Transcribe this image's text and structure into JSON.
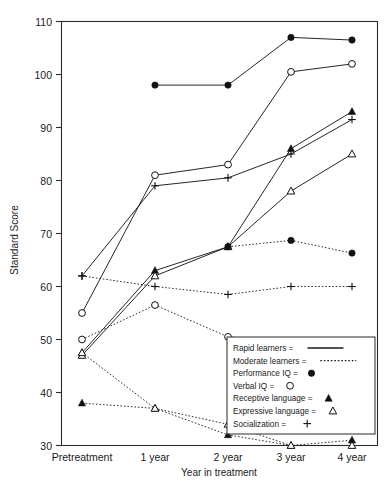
{
  "chart_data": {
    "type": "line",
    "title": "",
    "xlabel": "Year in treatment",
    "ylabel": "Standard Score",
    "categories": [
      "Pretreatment",
      "1 year",
      "2 year",
      "3 year",
      "4 year"
    ],
    "ylim": [
      30,
      110
    ],
    "yticks": [
      30,
      40,
      50,
      60,
      70,
      80,
      90,
      100,
      110
    ],
    "grid": false,
    "legend_position": "bottom-right",
    "series": [
      {
        "name": "Rapid learners — Performance IQ",
        "group": "Rapid learners",
        "measure": "Performance IQ",
        "line": "solid",
        "marker": "filled-circle",
        "values": [
          null,
          98.0,
          98.0,
          107.0,
          106.5
        ]
      },
      {
        "name": "Rapid learners — Verbal IQ",
        "group": "Rapid learners",
        "measure": "Verbal IQ",
        "line": "solid",
        "marker": "open-circle",
        "values": [
          55.0,
          81.0,
          83.0,
          100.5,
          102.0
        ]
      },
      {
        "name": "Rapid learners — Socialization",
        "group": "Rapid learners",
        "measure": "Socialization",
        "line": "solid",
        "marker": "plus",
        "values": [
          62.0,
          79.0,
          80.5,
          85.0,
          91.5
        ]
      },
      {
        "name": "Rapid learners — Receptive language",
        "group": "Rapid learners",
        "measure": "Receptive language",
        "line": "solid",
        "marker": "filled-triangle",
        "values": [
          47.5,
          63.0,
          67.5,
          86.0,
          93.0
        ]
      },
      {
        "name": "Rapid learners — Expressive language",
        "group": "Rapid learners",
        "measure": "Expressive language",
        "line": "solid",
        "marker": "open-triangle",
        "values": [
          47.0,
          62.0,
          67.5,
          78.0,
          85.0
        ]
      },
      {
        "name": "Moderate learners — Performance IQ",
        "group": "Moderate learners",
        "measure": "Performance IQ",
        "line": "dotted",
        "marker": "filled-circle",
        "values": [
          null,
          null,
          67.5,
          68.7,
          66.3
        ]
      },
      {
        "name": "Moderate learners — Verbal IQ",
        "group": "Moderate learners",
        "measure": "Verbal IQ",
        "line": "dotted",
        "marker": "open-circle",
        "values": [
          50.0,
          56.5,
          50.5,
          49.5,
          48.0
        ]
      },
      {
        "name": "Moderate learners — Socialization",
        "group": "Moderate learners",
        "measure": "Socialization",
        "line": "dotted",
        "marker": "plus",
        "values": [
          62.0,
          60.0,
          58.5,
          60.0,
          60.0
        ]
      },
      {
        "name": "Moderate learners — Receptive language",
        "group": "Moderate learners",
        "measure": "Receptive language",
        "line": "dotted",
        "marker": "filled-triangle",
        "values": [
          38.0,
          37.0,
          32.0,
          30.0,
          31.0
        ]
      },
      {
        "name": "Moderate learners — Expressive language",
        "group": "Moderate learners",
        "measure": "Expressive language",
        "line": "dotted",
        "marker": "open-triangle",
        "values": [
          47.5,
          37.0,
          34.0,
          30.0,
          30.0
        ]
      }
    ]
  },
  "legend": {
    "entries": [
      {
        "label": "Rapid learners =",
        "symbol": "solid-line"
      },
      {
        "label": "Moderate learners =",
        "symbol": "dotted-line"
      },
      {
        "label": "Performance IQ =",
        "symbol": "filled-circle"
      },
      {
        "label": "Verbal IQ =",
        "symbol": "open-circle"
      },
      {
        "label": "Receptive language =",
        "symbol": "filled-triangle"
      },
      {
        "label": "Expressive language =",
        "symbol": "open-triangle"
      },
      {
        "label": "Socialization =",
        "symbol": "plus"
      }
    ]
  }
}
